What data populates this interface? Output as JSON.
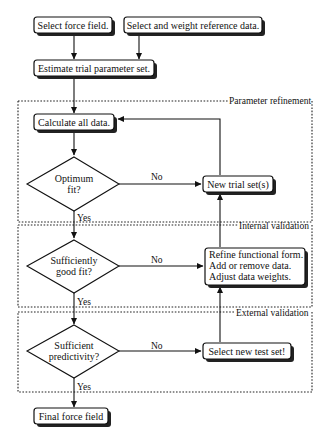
{
  "diagram": {
    "type": "flowchart",
    "nodes": {
      "select_force_field": "Select force field.",
      "select_reference_data": "Select and weight reference data.",
      "estimate_trial": "Estimate trial parameter set.",
      "calculate_all": "Calculate all data.",
      "optimum_fit": [
        "Optimum",
        "fit?"
      ],
      "new_trial_sets": "New trial set(s)",
      "sufficiently_good_fit": [
        "Sufficiently",
        "good fit?"
      ],
      "refine": [
        "Refine functional form.",
        "Add or remove data.",
        "Adjust data weights."
      ],
      "sufficient_predictivity": [
        "Sufficient",
        "predictivity?"
      ],
      "select_new_test_set": "Select new test set!",
      "final_force_field": "Final force field"
    },
    "regions": {
      "parameter_refinement": "Parameter refinement",
      "internal_validation": "Internal validation",
      "external_validation": "External validation"
    },
    "edge_labels": {
      "no": "No",
      "yes": "Yes"
    },
    "edges": [
      {
        "from": "select_force_field",
        "to": "estimate_trial"
      },
      {
        "from": "select_reference_data",
        "to": "estimate_trial"
      },
      {
        "from": "estimate_trial",
        "to": "calculate_all"
      },
      {
        "from": "calculate_all",
        "to": "optimum_fit"
      },
      {
        "from": "optimum_fit",
        "to": "new_trial_sets",
        "label": "No"
      },
      {
        "from": "new_trial_sets",
        "to": "calculate_all"
      },
      {
        "from": "optimum_fit",
        "to": "sufficiently_good_fit",
        "label": "Yes"
      },
      {
        "from": "sufficiently_good_fit",
        "to": "refine",
        "label": "No"
      },
      {
        "from": "refine",
        "to": "new_trial_sets"
      },
      {
        "from": "sufficiently_good_fit",
        "to": "sufficient_predictivity",
        "label": "Yes"
      },
      {
        "from": "sufficient_predictivity",
        "to": "select_new_test_set",
        "label": "No"
      },
      {
        "from": "select_new_test_set",
        "to": "refine"
      },
      {
        "from": "sufficient_predictivity",
        "to": "final_force_field",
        "label": "Yes"
      }
    ]
  }
}
